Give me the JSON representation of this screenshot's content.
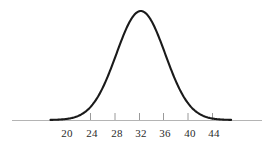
{
  "figure": {
    "width": 278,
    "height": 149,
    "background_color": "#ffffff",
    "curve_color": "#1a1a1a",
    "axis_color": "#b4b4b4",
    "tick_color": "#9a9a9a",
    "label_color": "#2b2b2b"
  },
  "chart_data": {
    "type": "line",
    "title": "",
    "subtitle": "",
    "xlabel": "",
    "ylabel": "",
    "grid": false,
    "legend": null,
    "curve": "normal-distribution",
    "mean": 32,
    "std_dev": 4,
    "xlim": [
      16,
      48
    ],
    "ylim": [
      0,
      1
    ],
    "axis_tick_values": [
      24,
      28,
      32,
      36,
      40,
      44
    ],
    "tick_labels": [
      "20",
      "24",
      "28",
      "32",
      "36",
      "40",
      "44"
    ],
    "tick_label_values": [
      20,
      24,
      28,
      32,
      36,
      40,
      44
    ],
    "x": [
      18,
      20,
      22,
      24,
      26,
      28,
      30,
      32,
      34,
      36,
      38,
      40,
      42,
      44,
      46
    ],
    "y": [
      0.0004,
      0.0044,
      0.0228,
      0.0668,
      0.1587,
      0.3247,
      0.6065,
      1.0,
      0.6065,
      0.3247,
      0.1587,
      0.0668,
      0.0228,
      0.0044,
      0.0004
    ],
    "annotations": []
  },
  "labels": [
    {
      "text": "20",
      "value": 20,
      "x_px": 67
    },
    {
      "text": "24",
      "value": 24,
      "x_px": 92
    },
    {
      "text": "28",
      "value": 28,
      "x_px": 117
    },
    {
      "text": "32",
      "value": 32,
      "x_px": 141
    },
    {
      "text": "36",
      "value": 36,
      "x_px": 165
    },
    {
      "text": "40",
      "value": 40,
      "x_px": 190
    },
    {
      "text": "44",
      "value": 44,
      "x_px": 214
    }
  ]
}
